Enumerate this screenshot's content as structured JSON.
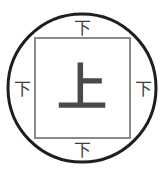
{
  "figure": {
    "background_color": "#ffffff",
    "circle": {
      "name": "outer-circle",
      "stroke_color": "#1e1e1e",
      "stroke_width": 3,
      "cx": 82,
      "cy": 88,
      "r": 74
    },
    "square": {
      "name": "inner-square",
      "stroke_color": "#8a8a8a",
      "stroke_width": 2,
      "x": 35,
      "y": 38,
      "width": 95,
      "height": 100
    },
    "center_glyph": {
      "name": "center-character",
      "text": "上",
      "color": "#4a4a4a"
    },
    "edge_glyphs": [
      {
        "name": "top-character",
        "text": "下",
        "position": "top",
        "color": "#3d3d3d"
      },
      {
        "name": "right-character",
        "text": "下",
        "position": "right",
        "color": "#3d3d3d"
      },
      {
        "name": "bottom-character",
        "text": "下",
        "position": "bottom",
        "color": "#3d3d3d"
      },
      {
        "name": "left-character",
        "text": "下",
        "position": "left",
        "color": "#3d3d3d"
      }
    ]
  }
}
